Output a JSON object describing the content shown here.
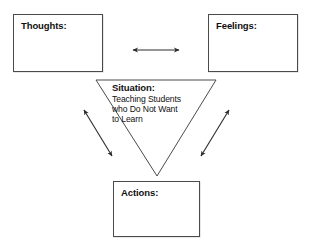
{
  "diagram": {
    "type": "cognitive-triangle",
    "background_color": "#ffffff",
    "line_color": "#3f3f3f",
    "text_color": "#111111"
  },
  "nodes": {
    "thoughts": {
      "label": "Thoughts:",
      "value": ""
    },
    "feelings": {
      "label": "Feelings:",
      "value": ""
    },
    "actions": {
      "label": "Actions:",
      "value": ""
    },
    "situation": {
      "label": "Situation:",
      "description": "Teaching Students who Do Not Want to Learn",
      "description_line1": "Teaching Students",
      "description_line2": "who Do Not Want",
      "description_line3": "to Learn"
    }
  },
  "connectors": [
    {
      "name": "thoughts-feelings-arrow",
      "style": "double-headed",
      "orientation": "horizontal"
    },
    {
      "name": "situation-thoughts-arrow",
      "style": "double-headed",
      "orientation": "diagonal-left"
    },
    {
      "name": "situation-feelings-arrow",
      "style": "double-headed",
      "orientation": "diagonal-right"
    }
  ]
}
